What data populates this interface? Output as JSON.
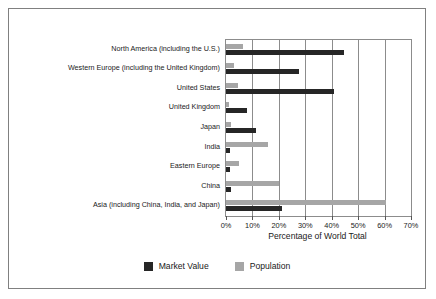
{
  "chart_data": {
    "type": "bar",
    "orientation": "horizontal",
    "title": "",
    "xlabel": "Percentage of World Total",
    "ylabel": "",
    "xlim": [
      0,
      70
    ],
    "xtick_labels": [
      "0%",
      "10%",
      "20%",
      "30%",
      "40%",
      "50%",
      "60%",
      "70%"
    ],
    "xticks": [
      0,
      10,
      20,
      30,
      40,
      50,
      60,
      70
    ],
    "grid": "vertical",
    "legend_position": "bottom-center",
    "categories": [
      "North America (including the U.S.)",
      "Western Europe (including the United Kingdom)",
      "United States",
      "United Kingdom",
      "Japan",
      "India",
      "Eastern Europe",
      "China",
      "Asia (including China, India, and Japan)"
    ],
    "series": [
      {
        "name": "Market Value",
        "color": "#262626",
        "values": [
          44.5,
          27.5,
          41.0,
          8.0,
          11.5,
          1.5,
          1.5,
          2.0,
          21.0
        ]
      },
      {
        "name": "Population",
        "color": "#a6a6a6",
        "values": [
          6.5,
          3.0,
          4.6,
          1.0,
          2.0,
          16.0,
          5.0,
          20.0,
          60.5
        ]
      }
    ]
  },
  "legend": {
    "items": [
      {
        "label": "Market Value",
        "color": "#262626"
      },
      {
        "label": "Population",
        "color": "#a6a6a6"
      }
    ]
  }
}
